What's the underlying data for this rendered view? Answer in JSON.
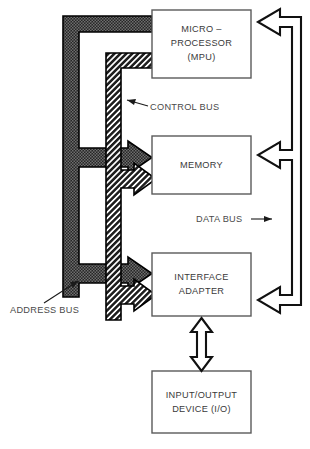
{
  "diagram": {
    "background_color": "#ffffff",
    "blocks": [
      {
        "id": "mpu",
        "name": "microprocessor-block",
        "lines": [
          "MICRO –",
          "PROCESSOR",
          "(MPU)"
        ],
        "line1": "MICRO –",
        "line2": "PROCESSOR",
        "line3": "(MPU)"
      },
      {
        "id": "memory",
        "name": "memory-block",
        "lines": [
          "MEMORY"
        ],
        "line1": "MEMORY"
      },
      {
        "id": "interface_adapter",
        "name": "interface-adapter-block",
        "lines": [
          "INTERFACE",
          "ADAPTER"
        ],
        "line1": "INTERFACE",
        "line2": "ADAPTER"
      },
      {
        "id": "io_device",
        "name": "io-device-block",
        "lines": [
          "INPUT/OUTPUT",
          "DEVICE (I/O)"
        ],
        "line1": "INPUT/OUTPUT",
        "line2": "DEVICE (I/O)"
      }
    ],
    "bus_labels": {
      "control": "CONTROL BUS",
      "data": "DATA BUS",
      "address": "ADDRESS BUS"
    },
    "colors": {
      "address_bus_fill": "#3b3b3b",
      "control_bus_fill": "#2e2e2e",
      "outline": "#000000",
      "box_stroke": "#5a5a5a",
      "text": "#3a3a3a",
      "background": "#ffffff"
    }
  }
}
